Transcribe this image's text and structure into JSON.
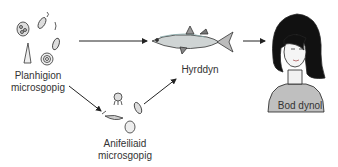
{
  "diagram": {
    "type": "food-chain",
    "nodes": {
      "phytoplankton": {
        "line1": "Planhigion",
        "line2": "microsgopig"
      },
      "zooplankton": {
        "line1": "Anifeiliaid",
        "line2": "microsgopig"
      },
      "fish": {
        "label": "Hyrddyn"
      },
      "human": {
        "label": "Bod dynol"
      }
    },
    "edges": [
      {
        "from": "phytoplankton",
        "to": "fish"
      },
      {
        "from": "phytoplankton",
        "to": "zooplankton"
      },
      {
        "from": "zooplankton",
        "to": "fish"
      },
      {
        "from": "fish",
        "to": "human"
      }
    ]
  }
}
